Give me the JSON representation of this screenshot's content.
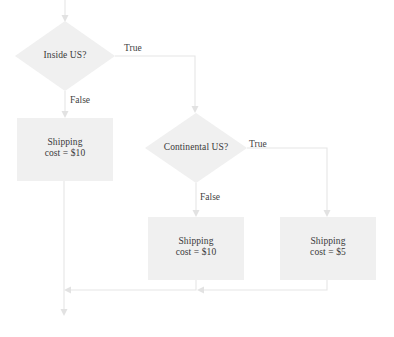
{
  "diagram": {
    "type": "flowchart",
    "nodes": [
      {
        "id": "inside-us",
        "shape": "diamond",
        "label": "Inside US?",
        "cx": 65,
        "cy": 56,
        "rx": 50,
        "ry": 35
      },
      {
        "id": "shipping-10-international",
        "shape": "rectangle",
        "label_line1": "Shipping",
        "label_line2": "cost = $10",
        "x": 17,
        "y": 118,
        "w": 96,
        "h": 63
      },
      {
        "id": "continental-us",
        "shape": "diamond",
        "label": "Continental US?",
        "cx": 196,
        "cy": 148,
        "rx": 51,
        "ry": 35
      },
      {
        "id": "shipping-10-noncontinental",
        "shape": "rectangle",
        "label_line1": "Shipping",
        "label_line2": "cost = $10",
        "x": 148,
        "y": 217,
        "w": 96,
        "h": 63
      },
      {
        "id": "shipping-5-continental",
        "shape": "rectangle",
        "label_line1": "Shipping",
        "label_line2": "cost = $5",
        "x": 280,
        "y": 217,
        "w": 96,
        "h": 63
      }
    ],
    "edges": [
      {
        "id": "entry-to-inside-us",
        "label": ""
      },
      {
        "id": "inside-us-true",
        "label": "True"
      },
      {
        "id": "inside-us-false",
        "label": "False"
      },
      {
        "id": "continental-us-true",
        "label": "True"
      },
      {
        "id": "continental-us-false",
        "label": "False"
      }
    ],
    "edge_labels": [
      {
        "id": "label-true-inside-us",
        "text": "True",
        "x": 124,
        "y": 43
      },
      {
        "id": "label-false-inside-us",
        "text": "False",
        "x": 70,
        "y": 95
      },
      {
        "id": "label-true-continental-us",
        "text": "True",
        "x": 249,
        "y": 139
      },
      {
        "id": "label-false-continental-us",
        "text": "False",
        "x": 200,
        "y": 192
      }
    ],
    "colors": {
      "shape_fill": "#f0f0f0",
      "line": "#e6e6e6",
      "text": "#3a3a3a",
      "background": "#ffffff"
    }
  }
}
